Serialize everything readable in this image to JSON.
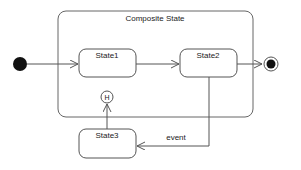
{
  "diagram": {
    "type": "uml-state-machine",
    "composite_state": {
      "label": "Composite State"
    },
    "states": [
      {
        "id": "state1",
        "label": "State1"
      },
      {
        "id": "state2",
        "label": "State2"
      },
      {
        "id": "state3",
        "label": "State3"
      }
    ],
    "pseudostates": {
      "initial": "initial-node",
      "final": "final-node",
      "history": {
        "label": "H"
      }
    },
    "transitions": [
      {
        "from": "initial",
        "to": "state1",
        "label": ""
      },
      {
        "from": "state1",
        "to": "state2",
        "label": ""
      },
      {
        "from": "state2",
        "to": "final",
        "label": ""
      },
      {
        "from": "state2",
        "to": "state3",
        "label": "event"
      },
      {
        "from": "state3",
        "to": "history",
        "label": ""
      }
    ],
    "colors": {
      "stroke": "#555555",
      "fill": "#ffffff",
      "node": "#111111"
    }
  }
}
